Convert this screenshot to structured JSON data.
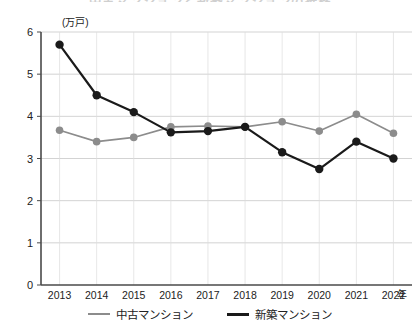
{
  "title_partial": "中古マンションと新築マンションの推移",
  "unit_label": "(万戸)",
  "x_unit": "年",
  "legend": {
    "items": [
      {
        "label": "中古マンション",
        "color": "#8c8c8c"
      },
      {
        "label": "新築マンション",
        "color": "#1a1a1a"
      }
    ]
  },
  "chart_data": {
    "type": "line",
    "title": "中古マンションと新築マンションの推移",
    "xlabel": "年",
    "ylabel": "(万戸)",
    "ylim": [
      0,
      6
    ],
    "yticks": [
      0,
      1,
      2,
      3,
      4,
      5,
      6
    ],
    "ytick_labels": [
      "0",
      "1",
      "2",
      "3",
      "4",
      "5",
      "6"
    ],
    "grid": true,
    "legend_position": "bottom",
    "categories": [
      "2013",
      "2014",
      "2015",
      "2016",
      "2017",
      "2018",
      "2019",
      "2020",
      "2021",
      "2022"
    ],
    "xtick_labels": [
      "2013",
      "2014",
      "2015",
      "2016",
      "2017",
      "2018",
      "2019",
      "2020",
      "2021",
      "2022"
    ],
    "series": [
      {
        "name": "中古マンション",
        "color": "#8c8c8c",
        "values": [
          3.67,
          3.4,
          3.5,
          3.75,
          3.77,
          3.75,
          3.87,
          3.65,
          4.05,
          3.6
        ]
      },
      {
        "name": "新築マンション",
        "color": "#1a1a1a",
        "values": [
          5.7,
          4.5,
          4.1,
          3.62,
          3.65,
          3.75,
          3.15,
          2.75,
          3.4,
          3.0
        ]
      }
    ]
  }
}
